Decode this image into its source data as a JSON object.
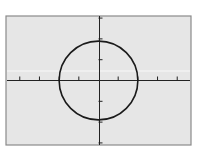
{
  "chart_data": {
    "type": "line",
    "title": "",
    "xlabel": "",
    "ylabel": "",
    "equation": "x^2 + y^2 = 4",
    "shape": "circle",
    "center": [
      0,
      0
    ],
    "radius": 2,
    "xlim": [
      -4.7,
      4.7
    ],
    "ylim": [
      -3.1,
      3.1
    ],
    "x_ticks": [
      -4,
      -3,
      -2,
      -1,
      1,
      2,
      3,
      4
    ],
    "y_ticks": [
      -3,
      -2,
      -1,
      1,
      2,
      3
    ],
    "grid": false,
    "legend": null
  },
  "colors": {
    "background": "#ffffff",
    "screen": "#e6e6e6",
    "frame": "#8a8a8a",
    "axis": "#222222",
    "curve": "#1a1a1a",
    "highlight_line": "#f7f7f7"
  }
}
